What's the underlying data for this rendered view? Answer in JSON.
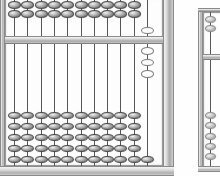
{
  "scene": {
    "title": "Soroban abacus photograph",
    "background_color": "#fefefe",
    "object_count": 2
  },
  "palette": {
    "frame_light": "#e9e9e9",
    "frame_mid": "#c8c8c8",
    "frame_dark": "#8d8d8d",
    "bead_highlight": "#f1f1f1",
    "bead_shadow": "#565656",
    "bead_hollow": "#ffffff",
    "rod_color": "#4a4a4a",
    "inner_panel": "#fdfdfd"
  },
  "abacus_primary": {
    "name": "soroban",
    "label": "main-abacus",
    "rod_count": 11,
    "heaven_beads_per_rod": 2,
    "earth_beads_per_rod": 5,
    "beam_label": "reckoning-bar",
    "geometry": {
      "x": 0,
      "y": -6,
      "width": 174,
      "height": 182,
      "inner_left": 5,
      "inner_right": 163,
      "inner_top": 4,
      "inner_bottom": 172,
      "beam_top": 42,
      "beam_height": 8,
      "rod_first_x": 14,
      "rod_spacing": 13.3,
      "bead_width": 13,
      "bead_height": 7.5
    },
    "rods": [
      {
        "index": 1,
        "heaven_state": "filled",
        "earth_state": "filled",
        "heaven_beads": 2,
        "earth_beads": 5
      },
      {
        "index": 2,
        "heaven_state": "filled",
        "earth_state": "filled",
        "heaven_beads": 2,
        "earth_beads": 5
      },
      {
        "index": 3,
        "heaven_state": "filled",
        "earth_state": "filled",
        "heaven_beads": 2,
        "earth_beads": 5
      },
      {
        "index": 4,
        "heaven_state": "filled",
        "earth_state": "filled",
        "heaven_beads": 2,
        "earth_beads": 5
      },
      {
        "index": 5,
        "heaven_state": "filled",
        "earth_state": "filled",
        "heaven_beads": 2,
        "earth_beads": 5
      },
      {
        "index": 6,
        "heaven_state": "filled",
        "earth_state": "filled",
        "heaven_beads": 2,
        "earth_beads": 5
      },
      {
        "index": 7,
        "heaven_state": "filled",
        "earth_state": "filled",
        "heaven_beads": 2,
        "earth_beads": 5
      },
      {
        "index": 8,
        "heaven_state": "filled",
        "earth_state": "filled",
        "heaven_beads": 2,
        "earth_beads": 5
      },
      {
        "index": 9,
        "heaven_state": "filled",
        "earth_state": "filled",
        "heaven_beads": 2,
        "earth_beads": 5
      },
      {
        "index": 10,
        "heaven_state": "filled",
        "earth_state": "filled",
        "heaven_beads": 2,
        "earth_beads": 5
      },
      {
        "index": 11,
        "heaven_state": "hollow",
        "earth_state": "hollow",
        "heaven_beads": 1,
        "earth_beads": 4,
        "note": "rightmost rod shows light/unset beads plus one dark bead resting on the base rail"
      }
    ]
  },
  "abacus_secondary": {
    "name": "soroban",
    "label": "second-abacus-partial",
    "clipped": "right edge of frame",
    "heaven_beads_visible": 2,
    "earth_beads_visible": 5,
    "geometry": {
      "x": 198,
      "y": 8,
      "width": 40,
      "height": 164,
      "beam_top": 46,
      "beam_height": 6,
      "rod_x": 12,
      "bead_width": 11,
      "bead_height": 7
    }
  }
}
